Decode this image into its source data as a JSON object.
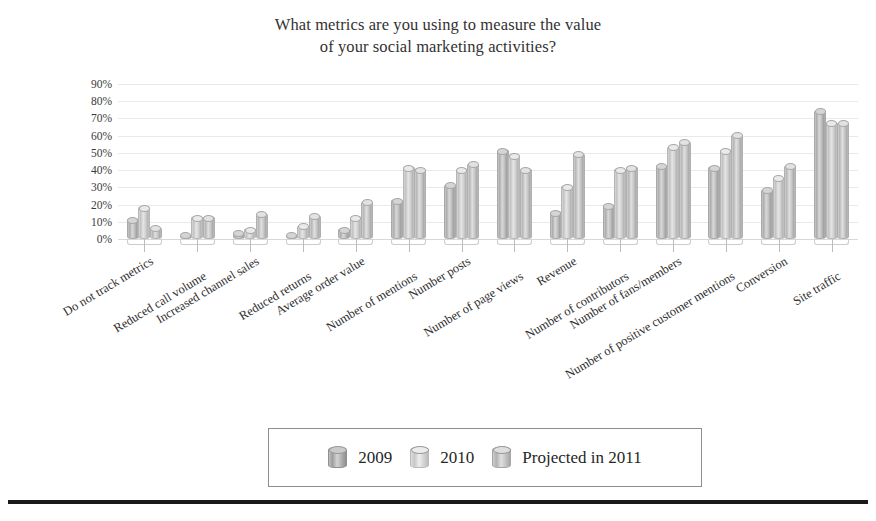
{
  "title": {
    "line1": "What metrics are you using to measure the value",
    "line2": "of your social marketing activities?"
  },
  "legend": {
    "items": [
      {
        "label": "2009",
        "key": "s2009"
      },
      {
        "label": "2010",
        "key": "s2010"
      },
      {
        "label": "Projected in 2011",
        "key": "s2011"
      }
    ]
  },
  "chart_data": {
    "type": "bar",
    "title": "What metrics are you using to measure the value of your social marketing activities?",
    "xlabel": "",
    "ylabel": "",
    "ylim": [
      0,
      90
    ],
    "ytick_labels": [
      "90%",
      "80%",
      "70%",
      "60%",
      "50%",
      "40%",
      "30%",
      "20%",
      "10%",
      "0%"
    ],
    "ytick_values": [
      90,
      80,
      70,
      60,
      50,
      40,
      30,
      20,
      10,
      0
    ],
    "grid": true,
    "legend_position": "bottom",
    "categories": [
      "Do not track metrics",
      "Reduced call volume",
      "Increased channel sales",
      "Reduced returns",
      "Average order value",
      "Number of mentions",
      "Number posts",
      "Number of page views",
      "Revenue",
      "Number of contributors",
      "Number of fans/members",
      "Number of positive customer mentions",
      "Conversion",
      "Site traffic"
    ],
    "series": [
      {
        "name": "2009",
        "values": [
          11,
          2,
          3,
          2,
          5,
          22,
          31,
          51,
          15,
          19,
          42,
          41,
          28,
          74
        ]
      },
      {
        "name": "2010",
        "values": [
          18,
          12,
          5,
          7,
          12,
          41,
          40,
          48,
          30,
          40,
          53,
          51,
          35,
          67
        ]
      },
      {
        "name": "Projected in 2011",
        "values": [
          6,
          12,
          14,
          13,
          21,
          40,
          43,
          40,
          49,
          41,
          56,
          60,
          42,
          67
        ]
      }
    ]
  }
}
